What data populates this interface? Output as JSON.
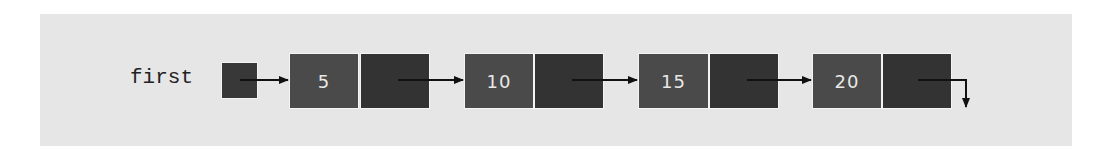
{
  "diagram": {
    "head_label": "first",
    "nodes": [
      {
        "value": "5"
      },
      {
        "value": "10"
      },
      {
        "value": "15"
      },
      {
        "value": "20"
      }
    ],
    "last_link": "null (arrow pointing down)"
  },
  "colors": {
    "background": "#e6e6e6",
    "data_box": "#4a4a4a",
    "pointer_box": "#333333",
    "text_on_box": "#e8e8e8",
    "arrow": "#111111"
  }
}
